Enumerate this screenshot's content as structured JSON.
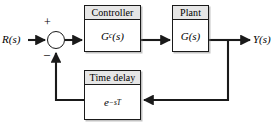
{
  "diagram": {
    "type": "control-system-block-diagram",
    "width": 276,
    "height": 128,
    "background_color": "#ffffff",
    "line_color": "#1a1a1a",
    "header_fill_color": "#e6e6e6"
  },
  "signals": {
    "input_label": "R(s)",
    "output_label": "Y(s)"
  },
  "summing_junction": {
    "name": "summing-junction",
    "plus_sign": "+",
    "minus_sign": "–",
    "plus_input": "R(s)",
    "minus_input": "feedback"
  },
  "blocks": [
    {
      "id": "controller",
      "header": "Controller",
      "transfer_function_text": "Gc(s)",
      "transfer_function_base": "G",
      "transfer_function_subscript": "c",
      "transfer_function_suffix": "(s)"
    },
    {
      "id": "plant",
      "header": "Plant",
      "transfer_function_text": "G(s)",
      "transfer_function_base": "G",
      "transfer_function_subscript": "",
      "transfer_function_suffix": "(s)"
    },
    {
      "id": "time_delay",
      "header": "Time delay",
      "transfer_function_text": "e^(-sT)",
      "transfer_function_base": "e",
      "transfer_function_exponent": "−sT",
      "transfer_function_suffix": ""
    }
  ],
  "connections": [
    {
      "from": "R(s)",
      "to": "summing-junction",
      "direction": "right"
    },
    {
      "from": "summing-junction",
      "to": "controller",
      "direction": "right"
    },
    {
      "from": "controller",
      "to": "plant",
      "direction": "right"
    },
    {
      "from": "plant",
      "to": "Y(s)",
      "direction": "right"
    },
    {
      "from": "plant-output-tap",
      "to": "time-delay",
      "direction": "down-then-left"
    },
    {
      "from": "time-delay",
      "to": "summing-junction",
      "direction": "left-then-up"
    }
  ]
}
